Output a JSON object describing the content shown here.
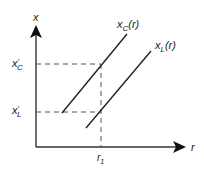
{
  "diagram": {
    "y_axis_label": "x",
    "x_axis_label": "r",
    "curves": [
      {
        "name": "x_C(r)",
        "label_main": "x",
        "label_sub": "C",
        "label_arg": "(r)"
      },
      {
        "name": "x_L(r)",
        "label_main": "x",
        "label_sub": "L",
        "label_arg": "(r)"
      }
    ],
    "y_ticks": [
      {
        "label_main": "x",
        "label_prime": "′",
        "label_sub": "C"
      },
      {
        "label_main": "x",
        "label_prime": "′",
        "label_sub": "L"
      }
    ],
    "x_ticks": [
      {
        "label_main": "r",
        "label_sub": "1"
      }
    ],
    "colors": {
      "line": "#222222",
      "axis": "#333333",
      "dashed": "#555555"
    }
  }
}
